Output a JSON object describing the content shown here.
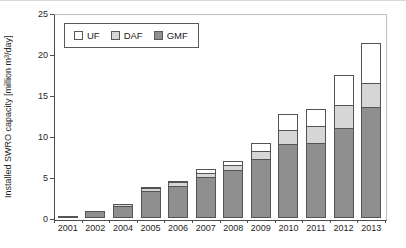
{
  "chart_data": {
    "type": "bar",
    "stacked": true,
    "title": "",
    "xlabel": "",
    "ylabel": "Installed SWRO capacity [million m³/day]",
    "ylim": [
      0,
      25
    ],
    "yticks": [
      0,
      5,
      10,
      15,
      20,
      25
    ],
    "grid": false,
    "legend_position": "top-left-inside",
    "legend_order": [
      "UF",
      "DAF",
      "GMF"
    ],
    "categories": [
      "2001",
      "2002",
      "2004",
      "2005",
      "2006",
      "2007",
      "2008",
      "2009",
      "2010",
      "2011",
      "2012",
      "2013"
    ],
    "series": [
      {
        "name": "GMF",
        "color": "#8f8f8f",
        "values": [
          0.3,
          0.9,
          1.5,
          3.3,
          3.9,
          5.0,
          5.9,
          7.2,
          9.0,
          9.2,
          11.0,
          13.5
        ]
      },
      {
        "name": "DAF",
        "color": "#d6d6d6",
        "values": [
          0,
          0,
          0.3,
          0.5,
          0.6,
          0.6,
          0.7,
          1.1,
          1.9,
          2.2,
          2.9,
          3.1
        ]
      },
      {
        "name": "UF",
        "color": "#ffffff",
        "values": [
          0,
          0,
          0,
          0.2,
          0.3,
          0.6,
          0.6,
          1.1,
          2.0,
          2.2,
          3.8,
          5.0
        ]
      }
    ],
    "totals": [
      0.3,
      0.9,
      1.8,
      4.0,
      4.8,
      6.2,
      7.2,
      9.4,
      12.9,
      13.6,
      17.7,
      21.6
    ],
    "colors": {
      "axis": "#4d4d4d",
      "plot_border_light": "#bfbfbf",
      "segment_border": "#545454",
      "text": "#262626"
    }
  }
}
